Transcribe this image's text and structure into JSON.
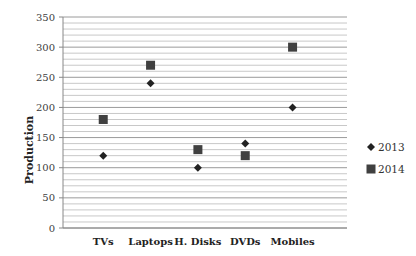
{
  "chart_data": {
    "type": "scatter",
    "title": "",
    "xlabel": "",
    "ylabel": "Production",
    "ylim": [
      0,
      350
    ],
    "yticks": [
      0,
      50,
      100,
      150,
      200,
      250,
      300,
      350
    ],
    "minor_grid_step": 10,
    "grid": true,
    "legend_position": "right",
    "categories": [
      "TVs",
      "Laptops",
      "H. Disks",
      "DVDs",
      "Mobiles"
    ],
    "series": [
      {
        "name": "2013",
        "marker": "diamond",
        "color": "#222222",
        "values": [
          120,
          240,
          100,
          140,
          200
        ]
      },
      {
        "name": "2014",
        "marker": "square",
        "color": "#404040",
        "values": [
          180,
          270,
          130,
          120,
          300
        ]
      }
    ]
  }
}
